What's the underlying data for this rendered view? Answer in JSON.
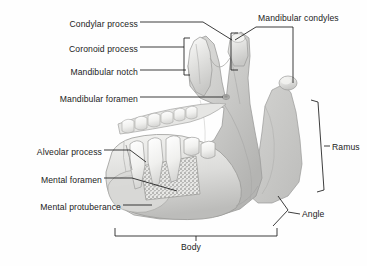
{
  "figure": {
    "style": "grayscale-anatomical-illustration",
    "background_color": "#fefefe",
    "ink_color": "#1b1b1b"
  },
  "labels": {
    "condylar_process": "Condylar process",
    "coronoid_process": "Coronoid process",
    "mandibular_notch": "Mandibular notch",
    "mandibular_foramen": "Mandibular foramen",
    "alveolar_process": "Alveolar process",
    "mental_foramen": "Mental foramen",
    "mental_protuberance": "Mental protuberance",
    "mandibular_condyles": "Mandibular condyles",
    "ramus": "Ramus",
    "angle": "Angle",
    "body": "Body"
  },
  "label_list": [
    {
      "id": "condylar-process",
      "text": "Condylar process",
      "side": "left",
      "x": 140,
      "y": 25
    },
    {
      "id": "coronoid-process",
      "text": "Coronoid process",
      "side": "left",
      "x": 140,
      "y": 50
    },
    {
      "id": "mandibular-notch",
      "text": "Mandibular notch",
      "side": "left",
      "x": 140,
      "y": 73
    },
    {
      "id": "mandibular-foramen",
      "text": "Mandibular foramen",
      "side": "left",
      "x": 140,
      "y": 100
    },
    {
      "id": "alveolar-process",
      "text": "Alveolar process",
      "side": "left",
      "x": 104,
      "y": 152
    },
    {
      "id": "mental-foramen",
      "text": "Mental foramen",
      "side": "left",
      "x": 104,
      "y": 180
    },
    {
      "id": "mental-protuberance",
      "text": "Mental protuberance",
      "side": "left",
      "x": 123,
      "y": 207
    },
    {
      "id": "mandibular-condyles",
      "text": "Mandibular condyles",
      "side": "top-right",
      "x": 258,
      "y": 17
    },
    {
      "id": "ramus",
      "text": "Ramus",
      "side": "right",
      "x": 330,
      "y": 147
    },
    {
      "id": "angle",
      "text": "Angle",
      "side": "right",
      "x": 303,
      "y": 214
    },
    {
      "id": "body",
      "text": "Body",
      "side": "bottom",
      "x": 196,
      "y": 247
    }
  ],
  "leaders": {
    "condylar_process": {
      "from": [
        140,
        22
      ],
      "to": [
        260,
        38
      ]
    },
    "coronoid_process": {
      "from": [
        140,
        47
      ],
      "to": [
        185,
        47
      ]
    },
    "mandibular_notch": {
      "from": [
        140,
        70
      ],
      "to": [
        186,
        70
      ]
    },
    "mandibular_foramen": {
      "from": [
        140,
        97
      ],
      "to": [
        224,
        97
      ]
    },
    "alveolar_process": {
      "from": [
        104,
        150
      ],
      "to": [
        152,
        158
      ]
    },
    "mental_foramen": {
      "from": [
        104,
        178
      ],
      "to": [
        179,
        190
      ]
    },
    "mental_protuberance": {
      "from": [
        123,
        205
      ],
      "to": [
        152,
        205
      ]
    },
    "mandibular_condyles": {
      "from": [
        258,
        27
      ],
      "fork_near": [
        233,
        40
      ],
      "fork_far": [
        293,
        85
      ]
    }
  },
  "brackets": {
    "coronoid": {
      "x": 185,
      "y_top": 38,
      "y_bottom": 75,
      "orientation": "left-facing"
    },
    "condyle": {
      "x": 232,
      "y_top": 33,
      "y_bottom": 70,
      "orientation": "left-facing"
    },
    "ramus": {
      "orientation": "right-facing",
      "y_top": 100,
      "y_bottom": 192
    },
    "angle": {
      "orientation": "chevron",
      "apex": [
        288,
        212
      ]
    },
    "body": {
      "x_left": 115,
      "x_right": 277,
      "y": 236,
      "orientation": "bottom-facing"
    }
  },
  "anatomy_parts": [
    "condylar-process",
    "coronoid-process",
    "mandibular-notch",
    "mandibular-foramen",
    "alveolar-process",
    "mental-foramen",
    "mental-protuberance",
    "mandibular-condyles",
    "ramus",
    "angle",
    "body",
    "teeth-row",
    "trabecular-bone-cutaway"
  ]
}
